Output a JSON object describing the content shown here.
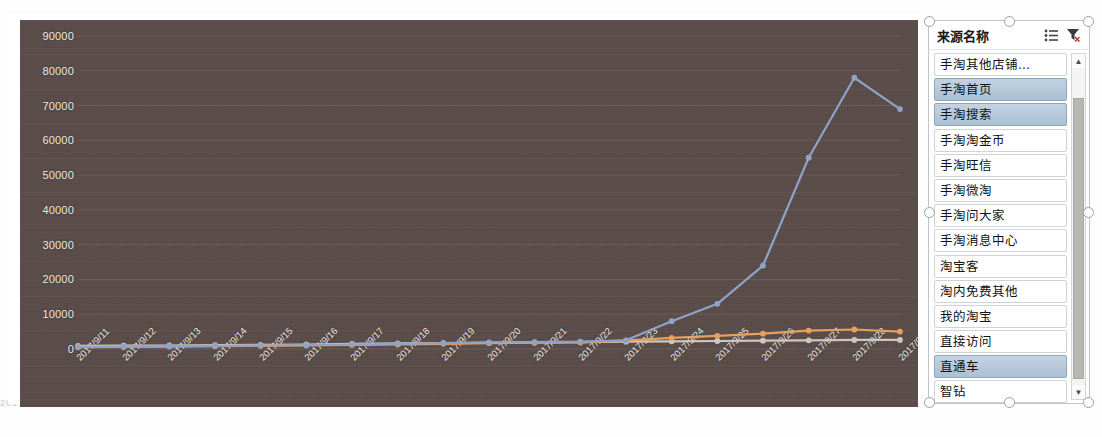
{
  "chart_data": {
    "type": "line",
    "title": "",
    "xlabel": "",
    "ylabel": "",
    "ylim": [
      0,
      90000
    ],
    "yticks": [
      0,
      10000,
      20000,
      30000,
      40000,
      50000,
      60000,
      70000,
      80000,
      90000
    ],
    "grid": true,
    "legend_position": "right-slicer",
    "categories": [
      "2017/9/11",
      "2017/9/12",
      "2017/9/13",
      "2017/9/14",
      "2017/9/15",
      "2017/9/16",
      "2017/9/17",
      "2017/9/18",
      "2017/9/19",
      "2017/9/20",
      "2017/9/21",
      "2017/9/22",
      "2017/9/23",
      "2017/9/24",
      "2017/9/25",
      "2017/9/26",
      "2017/9/27",
      "2017/9/28",
      "2017/9/29"
    ],
    "series": [
      {
        "name": "手淘首页",
        "color": "#8fa3c8",
        "values": [
          600,
          700,
          800,
          900,
          1000,
          1100,
          1300,
          1500,
          1700,
          1900,
          2000,
          2100,
          2500,
          8000,
          13000,
          24000,
          55000,
          78000,
          69000
        ]
      },
      {
        "name": "手淘搜索",
        "color": "#e8a05c",
        "values": [
          500,
          600,
          700,
          800,
          900,
          1000,
          1200,
          1300,
          1500,
          1700,
          1800,
          1900,
          2400,
          3200,
          3800,
          4400,
          5300,
          5600,
          5000
        ]
      },
      {
        "name": "直通车",
        "color": "#cfc6bd",
        "values": [
          900,
          950,
          1000,
          1100,
          1200,
          1300,
          1500,
          1600,
          1700,
          1800,
          1900,
          2000,
          2100,
          2200,
          2300,
          2400,
          2500,
          2600,
          2600
        ]
      }
    ]
  },
  "slicer": {
    "title": "来源名称",
    "icons": {
      "multiselect": "multiselect-icon",
      "clear_filter": "clear-filter-icon"
    },
    "items": [
      {
        "label": "手淘其他店铺...",
        "selected": false
      },
      {
        "label": "手淘首页",
        "selected": true
      },
      {
        "label": "手淘搜索",
        "selected": true
      },
      {
        "label": "手淘淘金币",
        "selected": false
      },
      {
        "label": "手淘旺信",
        "selected": false
      },
      {
        "label": "手淘微淘",
        "selected": false
      },
      {
        "label": "手淘问大家",
        "selected": false
      },
      {
        "label": "手淘消息中心",
        "selected": false
      },
      {
        "label": "淘宝客",
        "selected": false
      },
      {
        "label": "淘内免费其他",
        "selected": false
      },
      {
        "label": "我的淘宝",
        "selected": false
      },
      {
        "label": "直接访问",
        "selected": false
      },
      {
        "label": "直通车",
        "selected": true
      },
      {
        "label": "智钻",
        "selected": false
      }
    ],
    "scroll": {
      "up": "▲",
      "down": "▼"
    }
  },
  "sheet_bleed": {
    "text": "2017/9/30          70701          7600          4416          81790                 18494          5000          1112          2147"
  },
  "colors": {
    "plot_background": "#584b48",
    "axis_text": "#efe9e4",
    "series_blue": "#8fa3c8",
    "series_orange": "#e8a05c",
    "series_grey": "#cfc6bd",
    "slicer_selected": "#b5c8da"
  }
}
